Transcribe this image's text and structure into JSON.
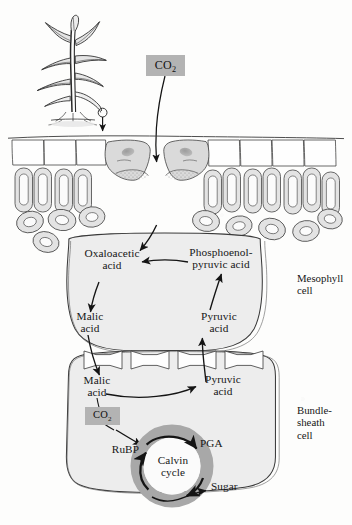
{
  "figure": {
    "background_color": "#fdfdfc",
    "ink_color": "#161616",
    "cell_fill_color": "#ebebeb",
    "co2_box_color": "#b3b3b3",
    "calvin_ring_color": "#a8a8a8"
  },
  "plant": {
    "name": "corn-plant-illustration",
    "description": "maize plant with leaves and roots"
  },
  "inputs": {
    "co2_atmospheric": "CO",
    "co2_atmospheric_sub": "2",
    "co2_bundle": "CO",
    "co2_bundle_sub": "2"
  },
  "leaf": {
    "epidermis": "upper epidermis cells",
    "guard_cells": "guard cells forming stoma",
    "palisade": "palisade mesophyll cells",
    "spongy": "spongy mesophyll cells"
  },
  "mesophyll": {
    "label": "Mesophyll\ncell",
    "metabolites": [
      {
        "name": "oxaloacetic-acid",
        "text": "Oxaloacetic\nacid"
      },
      {
        "name": "phosphoenolpyruvic-acid",
        "text": "Phosphoenol-\npyruvic acid"
      },
      {
        "name": "malic-acid",
        "text": "Malic\nacid"
      },
      {
        "name": "pyruvic-acid",
        "text": "Pyruvic\nacid"
      }
    ]
  },
  "bundle_sheath": {
    "label": "Bundle-\nsheath\ncell",
    "metabolites": [
      {
        "name": "malic-acid",
        "text": "Malic\nacid"
      },
      {
        "name": "pyruvic-acid",
        "text": "Pyruvic\nacid"
      }
    ],
    "cycle": {
      "name": "Calvin\ncycle",
      "inputs": "RuBP",
      "intermediate": "PGA",
      "output": "Sugar"
    }
  },
  "junction": {
    "plasmodesmata_count": 4,
    "label": "plasmodesmata channels"
  }
}
